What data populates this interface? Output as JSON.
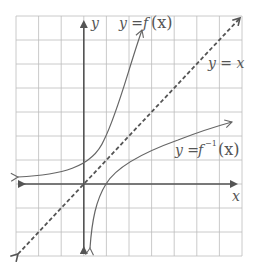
{
  "diagram": {
    "grid": {
      "columns": 10,
      "rows": 10,
      "color": "#bdbdbd"
    },
    "axes": {
      "x_label": "x",
      "y_label": "y",
      "color": "#555555"
    },
    "curves": [
      {
        "name": "f",
        "label_prefix": "y = ",
        "label_func": "f",
        "label_arg": "(x)",
        "style": "solid",
        "color": "#666666"
      },
      {
        "name": "f-inverse",
        "label_prefix": "y = ",
        "label_func": "f",
        "label_sup": "−1",
        "label_arg": "(x)",
        "style": "solid",
        "color": "#666666"
      },
      {
        "name": "identity",
        "label": "y = x",
        "style": "dashed",
        "color": "#555555"
      }
    ]
  }
}
